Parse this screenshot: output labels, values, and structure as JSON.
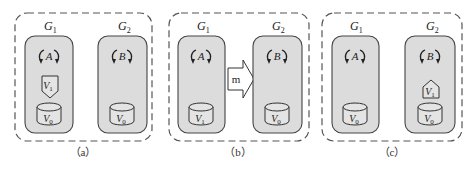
{
  "figure": {
    "panels": [
      {
        "id": "a",
        "caption": "（a）",
        "groups": [
          {
            "label": "G",
            "sub": "1",
            "process": "A",
            "volumes": [
              {
                "type": "snapshot-down",
                "label": "V",
                "sub": "1"
              },
              {
                "type": "cylinder",
                "label": "V",
                "sub": "0"
              }
            ]
          },
          {
            "label": "G",
            "sub": "2",
            "process": "B",
            "volumes": [
              {
                "type": "cylinder",
                "label": "V",
                "sub": "0"
              }
            ]
          }
        ]
      },
      {
        "id": "b",
        "caption": "（b）",
        "arrow_label": "m",
        "groups": [
          {
            "label": "G",
            "sub": "1",
            "process": "A",
            "volumes": [
              {
                "type": "cylinder",
                "label": "V",
                "sub": "1"
              }
            ]
          },
          {
            "label": "G",
            "sub": "2",
            "process": "B",
            "volumes": [
              {
                "type": "cylinder",
                "label": "V",
                "sub": "0"
              }
            ]
          }
        ]
      },
      {
        "id": "c",
        "caption": "（c）",
        "groups": [
          {
            "label": "G",
            "sub": "1",
            "process": "A",
            "volumes": [
              {
                "type": "cylinder",
                "label": "V",
                "sub": "0"
              }
            ]
          },
          {
            "label": "G",
            "sub": "2",
            "process": "B",
            "volumes": [
              {
                "type": "snapshot-up",
                "label": "V",
                "sub": "1"
              },
              {
                "type": "cylinder",
                "label": "V",
                "sub": "0"
              }
            ]
          }
        ]
      }
    ],
    "colors": {
      "group_fill": "#dcdcdc",
      "stroke": "#444444",
      "background": "#ffffff"
    }
  }
}
